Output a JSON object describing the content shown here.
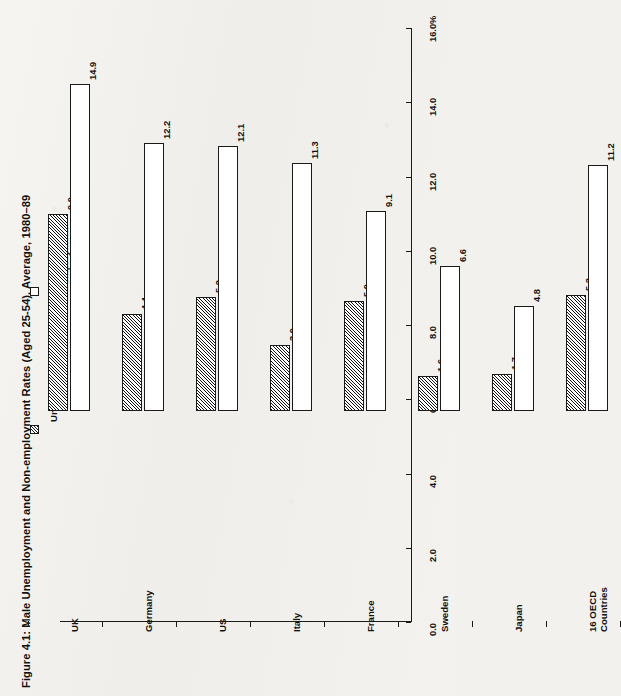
{
  "figure": {
    "title": "Figure 4.1: Male Unemployment and Non-employment Rates (Aged 25-54), Average, 1980–89",
    "axis_unit_label": "%"
  },
  "legend": {
    "items": [
      {
        "label": "Unemployment",
        "swatch": "hatched-square-icon"
      },
      {
        "label": "Non-employment",
        "swatch": "empty-square-icon"
      }
    ]
  },
  "chart_data": {
    "type": "bar",
    "title": "Figure 4.1: Male Unemployment and Non-employment Rates (Aged 25-54), Average, 1980–89",
    "orientation": "horizontal-rotated",
    "categories": [
      "UK",
      "Germany",
      "US",
      "Italy",
      "France",
      "Sweden",
      "Japan",
      "16 OECD Countries"
    ],
    "category_label_lines": [
      [
        "UK"
      ],
      [
        "Germany"
      ],
      [
        "US"
      ],
      [
        "Italy"
      ],
      [
        "France"
      ],
      [
        "Sweden"
      ],
      [
        "Japan"
      ],
      [
        "16 OECD",
        "Countries"
      ]
    ],
    "series": [
      {
        "name": "Unemployment",
        "values": [
          9.0,
          4.4,
          5.2,
          3.0,
          5.0,
          1.6,
          1.7,
          5.3
        ]
      },
      {
        "name": "Non-employment",
        "values": [
          14.9,
          12.2,
          12.1,
          11.3,
          9.1,
          6.6,
          4.8,
          11.2
        ]
      }
    ],
    "value_labels": {
      "Unemployment": [
        "9.0",
        "4.4",
        "5.2",
        "3.0",
        "5.0",
        "1.6",
        "1.7",
        "5.3"
      ],
      "Non-employment": [
        "14.9",
        "12.2",
        "12.1",
        "11.3",
        "9.1",
        "6.6",
        "4.8",
        "11.2"
      ]
    },
    "xlabel": "",
    "ylabel": "%",
    "ylim": [
      0.0,
      16.0
    ],
    "ytick_values": [
      0.0,
      2.0,
      4.0,
      6.0,
      8.0,
      10.0,
      12.0,
      14.0,
      16.0
    ],
    "ytick_labels": [
      "0.0",
      "2.0",
      "4.0",
      "6.0",
      "8.0",
      "10.0",
      "12.0",
      "14.0",
      "16.0"
    ],
    "grid": false,
    "legend_position": "left"
  },
  "colors": {
    "ink": "#1a1a1a",
    "paper": "#f2f1ee",
    "bar_fill": "#ffffff"
  }
}
